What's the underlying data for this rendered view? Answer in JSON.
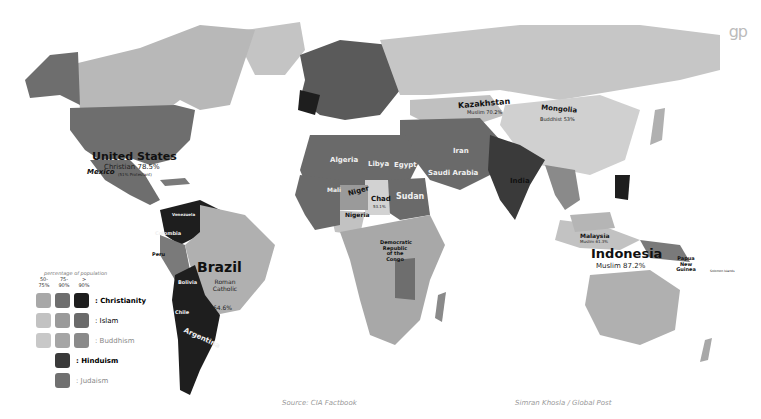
{
  "logo": "gp",
  "colors": {
    "christianity": [
      "#a8a8a8",
      "#6e6e6e",
      "#1e1e1e"
    ],
    "islam": [
      "#c2c2c2",
      "#9a9a9a",
      "#6a6a6a"
    ],
    "buddhism": [
      "#c8c8c8",
      "#a5a5a5",
      "#8a8a8a"
    ],
    "hinduism": "#3a3a3a",
    "judaism": "#707070",
    "land_default": "#c4c4c4"
  },
  "legend": {
    "heading": "percentage of population",
    "columns": [
      "50-75%",
      "75-90%",
      "> 90%"
    ],
    "rows": [
      {
        "label": ": Christianity",
        "bold": true
      },
      {
        "label": ": Islam",
        "bold": false
      },
      {
        "label": ": Buddhism",
        "bold": false
      },
      {
        "label": ": Hinduism",
        "bold": true
      },
      {
        "label": ": Judaism",
        "bold": false
      }
    ]
  },
  "countries": {
    "united_states": {
      "name": "United States",
      "religion": "Christian 78.5%",
      "note": "(51% Protestant)"
    },
    "mexico": {
      "name": "Mexico",
      "religion": "Roman Catholic"
    },
    "brazil": {
      "name": "Brazil",
      "religion": "Roman Catholic",
      "pct": "64.6%"
    },
    "colombia": {
      "name": "Colombia"
    },
    "venezuela": {
      "name": "Venezuela"
    },
    "peru": {
      "name": "Peru"
    },
    "bolivia": {
      "name": "Bolivia"
    },
    "chile": {
      "name": "Chile"
    },
    "argentina": {
      "name": "Argentina",
      "pct": "92%"
    },
    "kazakhstan": {
      "name": "Kazakhstan",
      "religion": "Muslim 70.2%"
    },
    "mongolia": {
      "name": "Mongolia",
      "religion": "Buddhist 53%"
    },
    "algeria": {
      "name": "Algeria",
      "religion": "Muslim (mostly Sunni)",
      "pct": "99%"
    },
    "libya": {
      "name": "Libya",
      "religion": "Sunni Muslim",
      "pct": "96.6%"
    },
    "egypt": {
      "name": "Egypt",
      "religion": "Muslim",
      "pct": "90%"
    },
    "saudi_arabia": {
      "name": "Saudi Arabia",
      "religion": "Muslim",
      "pct": "100%"
    },
    "iran": {
      "name": "Iran",
      "religion": "Muslim",
      "pct": "98%"
    },
    "mali": {
      "name": "Mali",
      "religion": "Muslim",
      "pct": "94.8%"
    },
    "niger": {
      "name": "Niger",
      "religion": "Muslim",
      "pct": "80%"
    },
    "chad": {
      "name": "Chad",
      "religion": "Muslim",
      "pct": "53.1%"
    },
    "sudan": {
      "name": "Sudan",
      "religion": "Sunni Muslim",
      "pct": "70%"
    },
    "nigeria": {
      "name": "Nigeria",
      "religion": "Muslim",
      "pct": "50%"
    },
    "drc": {
      "name": "Democratic Republic of the Congo",
      "religion": "Roman Catholic",
      "pct": "50%"
    },
    "india": {
      "name": "India",
      "religion": "Hindu",
      "pct": "80.5%"
    },
    "malaysia": {
      "name": "Malaysia",
      "religion": "Muslim 61.3%"
    },
    "indonesia": {
      "name": "Indonesia",
      "religion": "Muslim 87.2%"
    },
    "papua_new_guinea": {
      "name": "Papua New Guinea",
      "religion": "Protestant 71.4%"
    },
    "solomon_islands": {
      "name": "Solomon Islands"
    },
    "mauritania": {
      "name": "Mauritania"
    }
  },
  "footer": {
    "source": "Source: CIA Factbook",
    "credit": "Simran Khosla / Global Post"
  }
}
